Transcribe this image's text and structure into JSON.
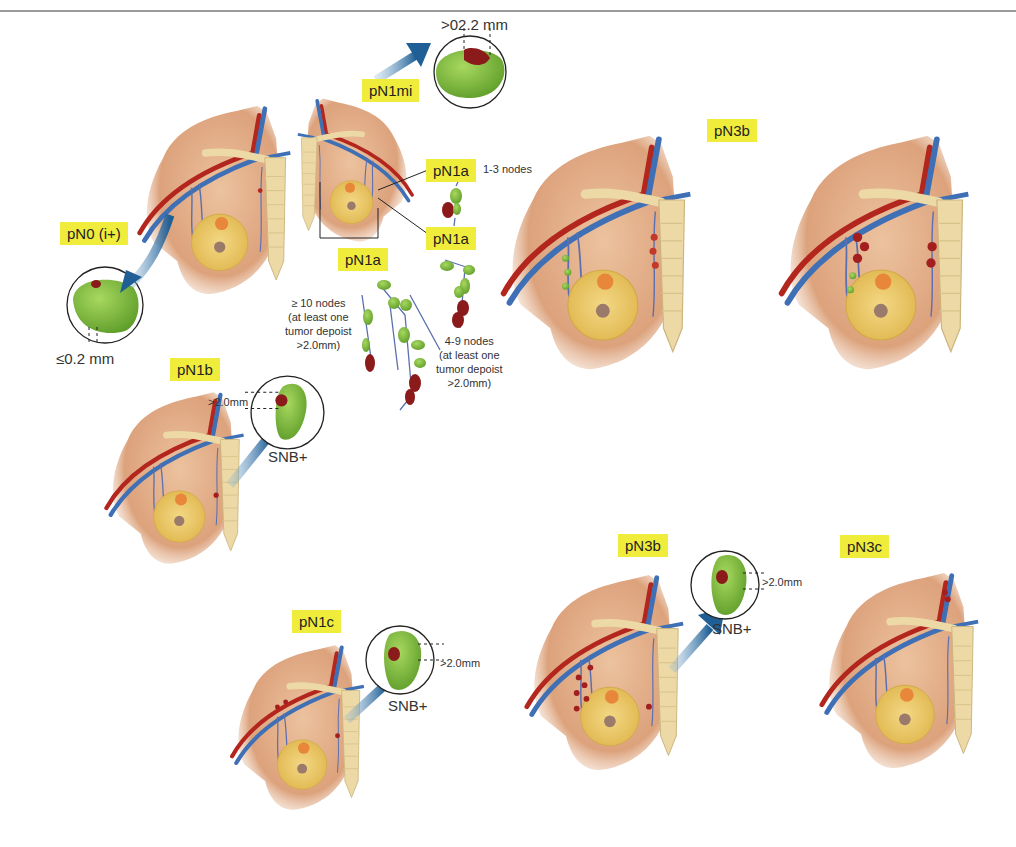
{
  "figure": {
    "colors": {
      "label_highlight": "#f0ec3c",
      "skin": "#e6b48f",
      "artery": "#b3261e",
      "vein": "#3f6fb5",
      "node_normal": "#8cc63f",
      "node_tumor": "#8b1a1a",
      "bone": "#ecd9a6",
      "arrow": "#2a6aa0"
    }
  },
  "panels": {
    "pN0i": {
      "label": "pN0 (i+)",
      "measure": "≤0.2 mm"
    },
    "pN1mi": {
      "label": "pN1mi",
      "measure": ">02.2 mm"
    },
    "pN1a": {
      "label_top": "pN1a",
      "label_mid": "pN1a",
      "label_bottom": "pN1a",
      "note_1_3": "1-3 nodes",
      "note_10_plus": [
        "≥ 10 nodes",
        "(at least one",
        "tumor depoist",
        ">2.0mm)"
      ],
      "note_4_9": [
        "4-9 nodes",
        "(at least one",
        "tumor depoist",
        ">2.0mm)"
      ]
    },
    "pN1b": {
      "label": "pN1b",
      "measure": ">2.0mm",
      "snb": "SNB+"
    },
    "pN1c": {
      "label": "pN1c",
      "measure": ">2.0mm",
      "snb": "SNB+"
    },
    "pN3b_top": {
      "label": "pN3b"
    },
    "pN3b_bottom": {
      "label": "pN3b",
      "measure": ">2.0mm",
      "snb": "SNB+"
    },
    "pN3c": {
      "label": "pN3c"
    }
  }
}
